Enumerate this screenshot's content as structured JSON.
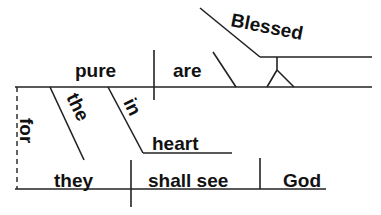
{
  "diagram": {
    "type": "sentence-diagram",
    "sentence": "Blessed are the pure in heart, for they shall see God",
    "colors": {
      "ink": "#111111",
      "background": "#ffffff"
    },
    "clause_main": {
      "subject": "pure",
      "verb": "are",
      "predicate_adjective": "Blessed",
      "modifiers": {
        "article": "the",
        "preposition": "in",
        "preposition_object": "heart"
      }
    },
    "conjunction": "for",
    "clause_sub": {
      "subject": "they",
      "verb": "shall see",
      "direct_object": "God"
    }
  }
}
